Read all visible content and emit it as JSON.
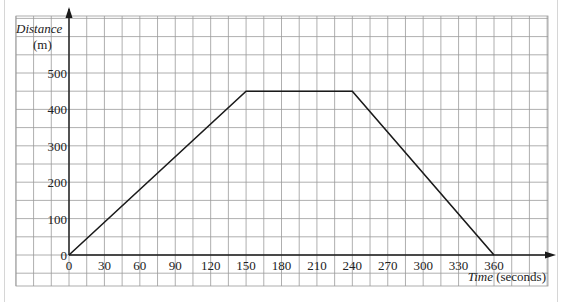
{
  "chart_data": {
    "type": "line",
    "title": "",
    "xlabel": "Time (seconds)",
    "xlabel_italic_part": "Time",
    "xlabel_unit": "(seconds)",
    "ylabel": "Distance (m)",
    "ylabel_italic_part": "Distance",
    "ylabel_unit": "(m)",
    "xlim": [
      0,
      360
    ],
    "ylim": [
      0,
      500
    ],
    "x_ticks": [
      0,
      30,
      60,
      90,
      120,
      150,
      180,
      210,
      240,
      270,
      300,
      330,
      360
    ],
    "y_ticks": [
      0,
      100,
      200,
      300,
      400,
      500
    ],
    "grid": true,
    "grid_minor_x": 15,
    "grid_minor_y": 50,
    "legend": null,
    "series": [
      {
        "name": "distance-time",
        "x": [
          0,
          150,
          240,
          360
        ],
        "y": [
          0,
          450,
          450,
          0
        ]
      }
    ]
  },
  "colors": {
    "grid": "#9a9a9a",
    "axis": "#1a1a1a",
    "line": "#1a1a1a",
    "border": "#c8c8c8"
  }
}
